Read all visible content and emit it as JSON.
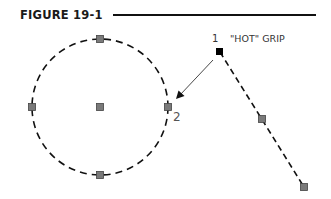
{
  "figure": {
    "title": "FIGURE 19-1",
    "labels": {
      "point1": "1",
      "hot_grip": "\"HOT\" GRIP",
      "point2": "2"
    }
  },
  "colors": {
    "line": "#111111",
    "grip_fill": "#7a7a7a",
    "grip_stroke": "#444444",
    "hot_grip_fill": "#000000",
    "leader": "#333333"
  },
  "circle": {
    "center": [
      100,
      107
    ],
    "radius": 68,
    "grips": [
      "center",
      "top quadrant",
      "bottom quadrant",
      "left quadrant",
      "right quadrant"
    ]
  },
  "line": {
    "start": [
      220,
      52
    ],
    "mid": [
      262,
      119
    ],
    "end": [
      304,
      187
    ],
    "hot_grip": "start"
  },
  "leader": {
    "from": [
      213,
      60
    ],
    "to": [
      177,
      98
    ]
  }
}
